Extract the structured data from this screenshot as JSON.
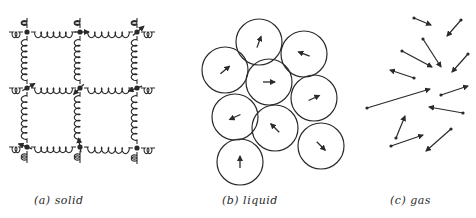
{
  "figure": {
    "panels": [
      {
        "id": "solid",
        "label": "(a) solid"
      },
      {
        "id": "liquid",
        "label": "(b) liquid"
      },
      {
        "id": "gas",
        "label": "(c) gas"
      }
    ],
    "colors": {
      "ink": "#2a2a2a",
      "background": "#ffffff"
    },
    "solid": {
      "nodes": [
        [
          27,
          32
        ],
        [
          80,
          32
        ],
        [
          137,
          32
        ],
        [
          27,
          88
        ],
        [
          80,
          88
        ],
        [
          137,
          88
        ],
        [
          27,
          147
        ],
        [
          80,
          147
        ],
        [
          137,
          148
        ]
      ],
      "arrows": [
        [
          27,
          88,
          -30
        ],
        [
          80,
          88,
          135
        ],
        [
          137,
          32,
          -40
        ],
        [
          137,
          88,
          160
        ],
        [
          27,
          147,
          200
        ],
        [
          80,
          147,
          -100
        ],
        [
          80,
          32,
          0
        ]
      ]
    },
    "liquid": {
      "radius": 23,
      "circles": [
        {
          "cx": 259,
          "cy": 42,
          "angle": -70
        },
        {
          "cx": 304,
          "cy": 54,
          "angle": 200
        },
        {
          "cx": 225,
          "cy": 70,
          "angle": -40
        },
        {
          "cx": 269,
          "cy": 82,
          "angle": 0
        },
        {
          "cx": 314,
          "cy": 98,
          "angle": -25
        },
        {
          "cx": 235,
          "cy": 117,
          "angle": 155
        },
        {
          "cx": 275,
          "cy": 128,
          "angle": -135
        },
        {
          "cx": 321,
          "cy": 146,
          "angle": 45
        },
        {
          "cx": 240,
          "cy": 162,
          "angle": -90
        }
      ]
    },
    "gas": {
      "arrows": [
        [
          414,
          18,
          431,
          25
        ],
        [
          461,
          20,
          447,
          36
        ],
        [
          423,
          39,
          441,
          67
        ],
        [
          402,
          51,
          432,
          67
        ],
        [
          468,
          54,
          452,
          72
        ],
        [
          414,
          78,
          390,
          70
        ],
        [
          367,
          108,
          430,
          89
        ],
        [
          441,
          95,
          468,
          86
        ],
        [
          463,
          113,
          429,
          107
        ],
        [
          396,
          138,
          405,
          116
        ],
        [
          391,
          146,
          423,
          135
        ],
        [
          451,
          129,
          426,
          151
        ]
      ]
    }
  }
}
